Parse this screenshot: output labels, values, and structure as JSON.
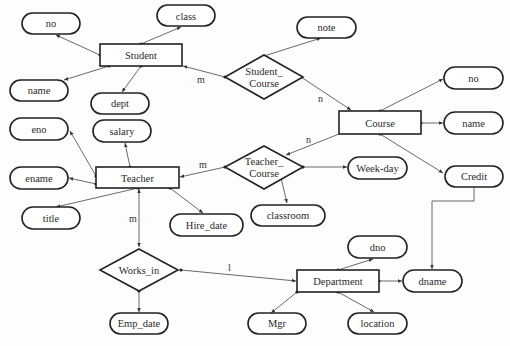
{
  "diagram": {
    "type": "ER diagram",
    "entities": [
      {
        "id": "student",
        "label": "Student",
        "x": 100,
        "y": 44,
        "w": 82,
        "h": 22
      },
      {
        "id": "course",
        "label": "Course",
        "x": 339,
        "y": 111,
        "w": 82,
        "h": 23
      },
      {
        "id": "teacher",
        "label": "Teacher",
        "x": 96,
        "y": 167,
        "w": 83,
        "h": 21
      },
      {
        "id": "department",
        "label": "Department",
        "x": 297,
        "y": 270,
        "w": 82,
        "h": 22
      }
    ],
    "relationships": [
      {
        "id": "student_course",
        "label_line1": "Student_",
        "label_line2": "Course",
        "cx": 264,
        "cy": 77
      },
      {
        "id": "teacher_course",
        "label_line1": "Teacher_",
        "label_line2": "Course",
        "cx": 264,
        "cy": 167
      },
      {
        "id": "works_in",
        "label_line1": "Works_in",
        "label_line2": "",
        "cx": 139,
        "cy": 269
      }
    ],
    "attributes": [
      {
        "id": "student_no",
        "label": "no",
        "cx": 51,
        "cy": 23
      },
      {
        "id": "student_class",
        "label": "class",
        "cx": 186,
        "cy": 16
      },
      {
        "id": "student_name",
        "label": "name",
        "cx": 39,
        "cy": 90
      },
      {
        "id": "student_dept",
        "label": "dept",
        "cx": 120,
        "cy": 103
      },
      {
        "id": "sc_note",
        "label": "note",
        "cx": 326,
        "cy": 27
      },
      {
        "id": "course_no",
        "label": "no",
        "cx": 474,
        "cy": 78
      },
      {
        "id": "course_name",
        "label": "name",
        "cx": 474,
        "cy": 123
      },
      {
        "id": "course_credit",
        "label": "Credit",
        "cx": 474,
        "cy": 176
      },
      {
        "id": "teacher_eno",
        "label": "eno",
        "cx": 39,
        "cy": 129
      },
      {
        "id": "teacher_salary",
        "label": "salary",
        "cx": 122,
        "cy": 131
      },
      {
        "id": "teacher_ename",
        "label": "ename",
        "cx": 39,
        "cy": 178
      },
      {
        "id": "teacher_title",
        "label": "title",
        "cx": 51,
        "cy": 218
      },
      {
        "id": "teacher_hire_date",
        "label": "Hire_date",
        "cx": 206,
        "cy": 225
      },
      {
        "id": "tc_weekday",
        "label": "Week-day",
        "cx": 377,
        "cy": 168
      },
      {
        "id": "tc_classroom",
        "label": "classroom",
        "cx": 288,
        "cy": 215
      },
      {
        "id": "works_emp_date",
        "label": "Emp_date",
        "cx": 139,
        "cy": 323
      },
      {
        "id": "dept_dno",
        "label": "dno",
        "cx": 377,
        "cy": 247
      },
      {
        "id": "dept_dname",
        "label": "dname",
        "cx": 432,
        "cy": 281
      },
      {
        "id": "dept_mgr",
        "label": "Mgr",
        "cx": 277,
        "cy": 323
      },
      {
        "id": "dept_location",
        "label": "location",
        "cx": 377,
        "cy": 323
      }
    ],
    "cardinalities": [
      {
        "id": "card_student_sc",
        "label": "m",
        "x": 197,
        "y": 83
      },
      {
        "id": "card_course_sc",
        "label": "n",
        "x": 318,
        "y": 102
      },
      {
        "id": "card_course_tc",
        "label": "n",
        "x": 306,
        "y": 143
      },
      {
        "id": "card_teacher_tc",
        "label": "m",
        "x": 199,
        "y": 168
      },
      {
        "id": "card_teacher_works",
        "label": "m",
        "x": 129,
        "y": 222
      },
      {
        "id": "card_dept_works",
        "label": "l",
        "x": 228,
        "y": 271
      }
    ]
  }
}
